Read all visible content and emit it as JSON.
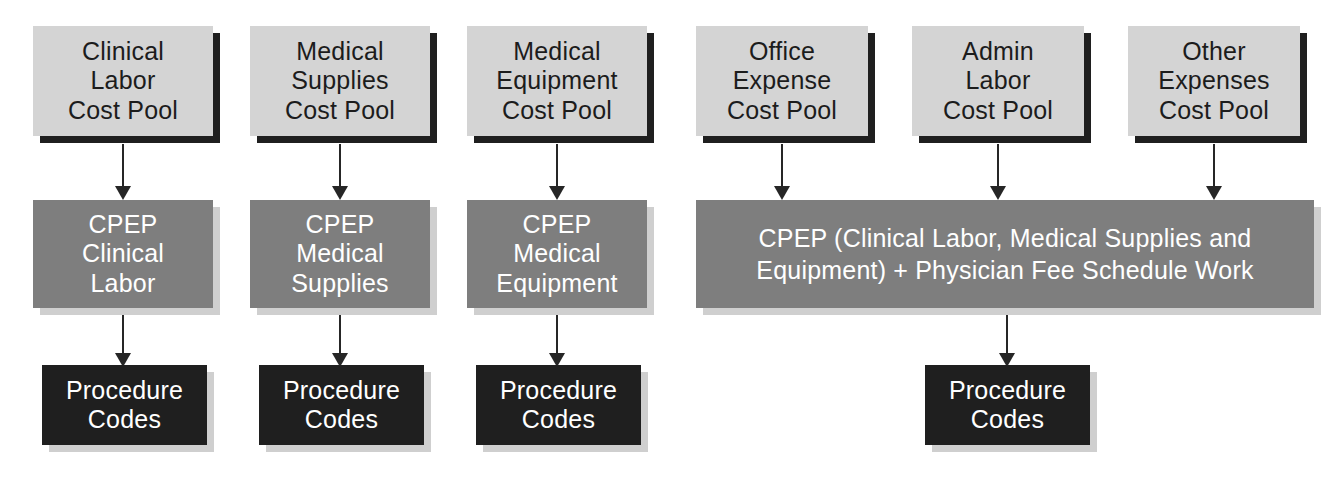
{
  "diagram": {
    "colors": {
      "pool_fill": "#d4d4d4",
      "pool_shadow": "#1f1f1f",
      "cpep_fill": "#7e7e7e",
      "cpep_text": "#ffffff",
      "procedure_fill": "#1f1f1f",
      "procedure_text": "#ffffff",
      "soft_shadow": "#cfcfcf",
      "arrow": "#262626",
      "background": "#ffffff"
    },
    "cost_pools": [
      {
        "id": "clinical-labor",
        "label": "Clinical\nLabor\nCost Pool"
      },
      {
        "id": "medical-supplies",
        "label": "Medical\nSupplies\nCost Pool"
      },
      {
        "id": "medical-equipment",
        "label": "Medical\nEquipment\nCost Pool"
      },
      {
        "id": "office-expense",
        "label": "Office\nExpense\nCost Pool"
      },
      {
        "id": "admin-labor",
        "label": "Admin\nLabor\nCost Pool"
      },
      {
        "id": "other-expenses",
        "label": "Other\nExpenses\nCost Pool"
      }
    ],
    "cpep_boxes": [
      {
        "id": "cpep-clinical-labor",
        "label": "CPEP\nClinical\nLabor"
      },
      {
        "id": "cpep-medical-supplies",
        "label": "CPEP\nMedical\nSupplies"
      },
      {
        "id": "cpep-medical-equipment",
        "label": "CPEP\nMedical\nEquipment"
      }
    ],
    "cpep_combined": {
      "id": "cpep-combined",
      "label": "CPEP (Clinical Labor, Medical Supplies and\nEquipment) + Physician Fee Schedule Work"
    },
    "procedure_codes": [
      {
        "id": "procedure-codes-1",
        "label": "Procedure\nCodes"
      },
      {
        "id": "procedure-codes-2",
        "label": "Procedure\nCodes"
      },
      {
        "id": "procedure-codes-3",
        "label": "Procedure\nCodes"
      },
      {
        "id": "procedure-codes-4",
        "label": "Procedure\nCodes"
      }
    ],
    "arrows": [
      {
        "id": "arrow-clinical-labor-to-cpep",
        "from": "clinical-labor",
        "to": "cpep-clinical-labor"
      },
      {
        "id": "arrow-medical-supplies-to-cpep",
        "from": "medical-supplies",
        "to": "cpep-medical-supplies"
      },
      {
        "id": "arrow-medical-equipment-to-cpep",
        "from": "medical-equipment",
        "to": "cpep-medical-equipment"
      },
      {
        "id": "arrow-office-expense-to-combined",
        "from": "office-expense",
        "to": "cpep-combined"
      },
      {
        "id": "arrow-admin-labor-to-combined",
        "from": "admin-labor",
        "to": "cpep-combined"
      },
      {
        "id": "arrow-other-expenses-to-combined",
        "from": "other-expenses",
        "to": "cpep-combined"
      },
      {
        "id": "arrow-cpep-clinical-to-procedure",
        "from": "cpep-clinical-labor",
        "to": "procedure-codes-1"
      },
      {
        "id": "arrow-cpep-supplies-to-procedure",
        "from": "cpep-medical-supplies",
        "to": "procedure-codes-2"
      },
      {
        "id": "arrow-cpep-equipment-to-procedure",
        "from": "cpep-medical-equipment",
        "to": "procedure-codes-3"
      },
      {
        "id": "arrow-combined-to-procedure",
        "from": "cpep-combined",
        "to": "procedure-codes-4"
      }
    ]
  }
}
